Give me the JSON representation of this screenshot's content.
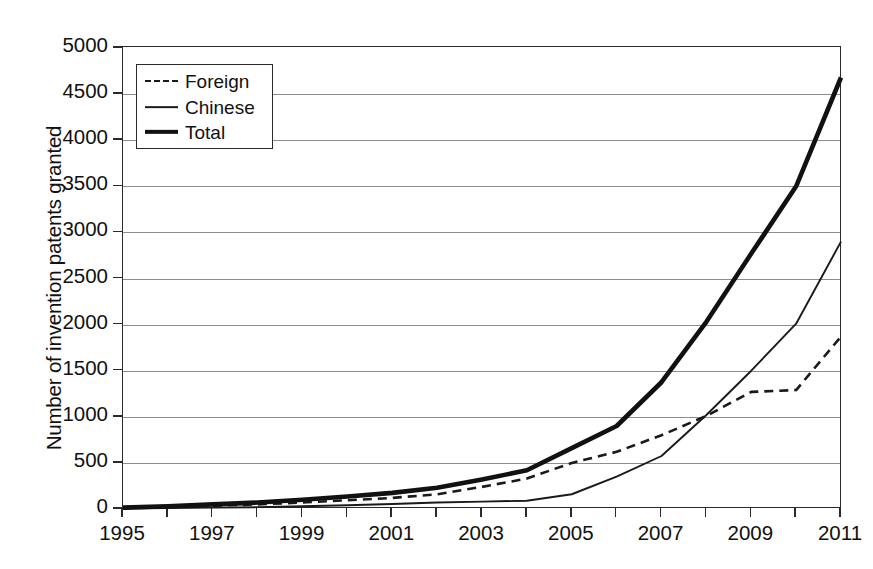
{
  "figure": {
    "y_axis_title": "Number of invention patents granted"
  },
  "legend": {
    "position": "top-left-inside",
    "items": [
      {
        "label": "Foreign",
        "style": "dashed",
        "icon": "dashed-line-swatch"
      },
      {
        "label": "Chinese",
        "style": "thin-solid",
        "icon": "thin-line-swatch"
      },
      {
        "label": "Total",
        "style": "thick-solid",
        "icon": "thick-line-swatch"
      }
    ]
  },
  "axes": {
    "y_ticks": [
      "0",
      "500",
      "1000",
      "1500",
      "2000",
      "2500",
      "3000",
      "3500",
      "4000",
      "4500",
      "5000"
    ],
    "x_ticks": [
      "1995",
      "1997",
      "1999",
      "2001",
      "2003",
      "2005",
      "2007",
      "2009",
      "2011"
    ]
  },
  "chart_data": {
    "type": "line",
    "title": "",
    "subtitle": "",
    "xlabel": "",
    "ylabel": "Number of invention patents granted",
    "xlim": [
      1995,
      2011
    ],
    "ylim": [
      0,
      5000
    ],
    "ytick_step": 500,
    "xtick_step_labeled": 2,
    "grid": true,
    "grid_axis": "y",
    "legend_position": "upper left",
    "x": [
      1995,
      1996,
      1997,
      1998,
      1999,
      2000,
      2001,
      2002,
      2003,
      2004,
      2005,
      2006,
      2007,
      2008,
      2009,
      2010,
      2011
    ],
    "series": [
      {
        "name": "Foreign",
        "style": "dashed",
        "color": "#1a1a1a",
        "values": [
          10,
          20,
          35,
          50,
          70,
          95,
          120,
          160,
          240,
          330,
          500,
          620,
          800,
          1010,
          1270,
          1290,
          1870
        ]
      },
      {
        "name": "Chinese",
        "style": "thin-solid",
        "color": "#1a1a1a",
        "values": [
          5,
          10,
          15,
          20,
          30,
          40,
          55,
          70,
          80,
          90,
          160,
          350,
          575,
          1020,
          1500,
          2010,
          2900
        ]
      },
      {
        "name": "Total",
        "style": "thick-solid",
        "color": "#111111",
        "values": [
          15,
          30,
          50,
          70,
          100,
          135,
          175,
          230,
          320,
          420,
          660,
          900,
          1375,
          2030,
          2770,
          3500,
          4680
        ]
      }
    ]
  }
}
